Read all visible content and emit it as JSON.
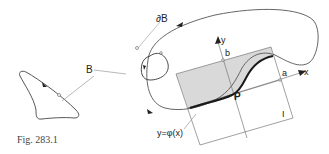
{
  "figure": {
    "caption": "Fig. 283.1",
    "labels": {
      "boundary": "∂B",
      "region": "B",
      "y_axis": "y",
      "x_axis": "x",
      "b": "b",
      "a": "a",
      "point": "P",
      "interval": "I",
      "function": "y=φ(x)"
    },
    "colors": {
      "line": "#555555",
      "curve": "#1a1a1a",
      "shade": "#d9d9d9",
      "background": "#ffffff"
    }
  }
}
